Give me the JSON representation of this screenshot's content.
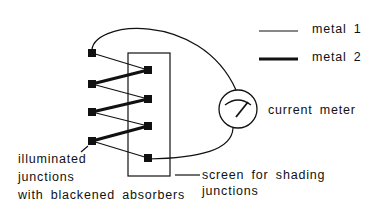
{
  "legend": {
    "metal1": {
      "label": "metal  1",
      "stroke_width": 1.2
    },
    "metal2": {
      "label": "metal  2",
      "stroke_width": 3
    }
  },
  "labels": {
    "meter": "current  meter",
    "illuminated": [
      "illuminated",
      "junctions",
      "with  blackened  absorbers"
    ],
    "screen": [
      "screen for shading",
      "junctions"
    ]
  },
  "colors": {
    "line": "#111111",
    "background": "#ffffff"
  }
}
